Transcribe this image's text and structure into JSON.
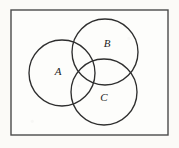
{
  "figure": {
    "kind": "venn-diagram",
    "set_count": 3,
    "background_color": "#fbfaf7",
    "stroke_color": "#2e2e2e",
    "border_color": "#4a4a4a"
  },
  "universe": {
    "name": "universe-rectangle",
    "x": 11,
    "y": 10,
    "width": 157,
    "height": 125
  },
  "sets": [
    {
      "label": "A",
      "cx": 62,
      "cy": 73,
      "r": 33,
      "label_x": 58,
      "label_y": 72
    },
    {
      "label": "B",
      "cx": 105,
      "cy": 52,
      "r": 33,
      "label_x": 107,
      "label_y": 44
    },
    {
      "label": "C",
      "cx": 104,
      "cy": 92,
      "r": 33,
      "label_x": 104,
      "label_y": 98
    }
  ]
}
